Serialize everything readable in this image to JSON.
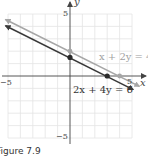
{
  "figure": {
    "caption": "Figure 7.9",
    "axes": {
      "x_label": "x",
      "y_label": "y",
      "x_range": [
        -5,
        5
      ],
      "y_range": [
        -5,
        5
      ],
      "ticks": {
        "x_neg": "−5",
        "x_pos": "5",
        "y_pos": "5",
        "y_neg": "−5"
      },
      "grid": true
    },
    "lines": [
      {
        "equation": "x + 2y = 4",
        "color": "#a6a6a6",
        "slope": -0.5,
        "intercept": 2,
        "points": [
          [
            0,
            2
          ],
          [
            4,
            0
          ]
        ]
      },
      {
        "equation": "2x + 4y = 6",
        "color": "#3a3a3a",
        "slope": -0.5,
        "intercept": 1.5,
        "points": [
          [
            0,
            1.5
          ],
          [
            3,
            0
          ]
        ]
      }
    ]
  }
}
